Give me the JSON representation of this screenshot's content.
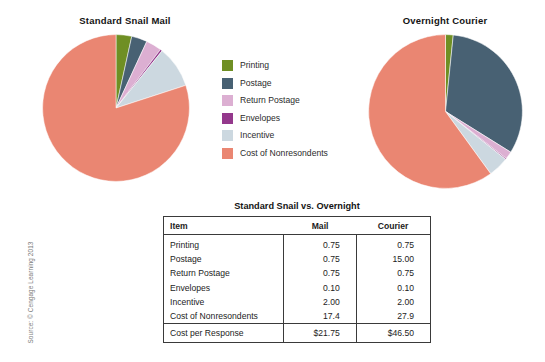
{
  "source_credit": "Source: © Cengage Learning 2013",
  "palette": {
    "printing": "#6f8f24",
    "postage": "#486173",
    "return_postage": "#dcafd2",
    "envelopes": "#94388c",
    "incentive": "#ccd8e0",
    "cost_of_nonresondents": "#ea8672"
  },
  "legend": {
    "items": [
      {
        "label": "Printing",
        "color": "#6f8f24",
        "key": "printing"
      },
      {
        "label": "Postage",
        "color": "#486173",
        "key": "postage"
      },
      {
        "label": "Return Postage",
        "color": "#dcafd2",
        "key": "return-postage"
      },
      {
        "label": "Envelopes",
        "color": "#94388c",
        "key": "envelopes"
      },
      {
        "label": "Incentive",
        "color": "#ccd8e0",
        "key": "incentive"
      },
      {
        "label": "Cost of Nonresondents",
        "color": "#ea8672",
        "key": "cost-of-nonresondents"
      }
    ]
  },
  "table": {
    "title": "Standard Snail vs. Overnight",
    "headers": [
      "Item",
      "Mail",
      "Courier"
    ],
    "rows": [
      {
        "item": "Printing",
        "mail": "0.75",
        "courier": "0.75"
      },
      {
        "item": "Postage",
        "mail": "0.75",
        "courier": "15.00"
      },
      {
        "item": "Return Postage",
        "mail": "0.75",
        "courier": "0.75"
      },
      {
        "item": "Envelopes",
        "mail": "0.10",
        "courier": "0.10"
      },
      {
        "item": "Incentive",
        "mail": "2.00",
        "courier": "2.00"
      },
      {
        "item": "Cost of Nonresondents",
        "mail": "17.4",
        "courier": "27.9"
      }
    ],
    "total": {
      "item": "Cost per Response",
      "mail": "$21.75",
      "courier": "$46.50"
    }
  },
  "chart_data": [
    {
      "type": "pie",
      "title": "Standard Snail Mail",
      "labels": [
        "Printing",
        "Postage",
        "Return Postage",
        "Envelopes",
        "Incentive",
        "Cost of Nonresondents"
      ],
      "values": [
        0.75,
        0.75,
        0.75,
        0.1,
        2.0,
        17.4
      ],
      "unit": "dollars",
      "total": 21.75,
      "colors": [
        "#6f8f24",
        "#486173",
        "#dcafd2",
        "#94388c",
        "#ccd8e0",
        "#ea8672"
      ],
      "legend_position": "center",
      "start_angle_deg": 0
    },
    {
      "type": "pie",
      "title": "Overnight Courier",
      "labels": [
        "Printing",
        "Postage",
        "Return Postage",
        "Envelopes",
        "Incentive",
        "Cost of Nonresondents"
      ],
      "values": [
        0.75,
        15.0,
        0.75,
        0.1,
        2.0,
        27.9
      ],
      "unit": "dollars",
      "total": 46.5,
      "colors": [
        "#6f8f24",
        "#486173",
        "#dcafd2",
        "#94388c",
        "#ccd8e0",
        "#ea8672"
      ],
      "legend_position": "center",
      "start_angle_deg": 0
    }
  ]
}
